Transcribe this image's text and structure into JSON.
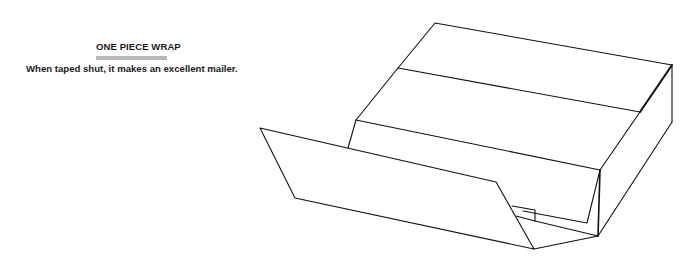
{
  "header": {
    "title": "ONE PIECE WRAP",
    "caption": "When taped shut, it makes an excellent mailer."
  },
  "illustration": {
    "subject": "one-piece-wrap-box",
    "description": "Line drawing of an open one-piece wrap corrugated box with front flap folded down",
    "colors": {
      "line": "#111111",
      "accent_bar": "#b8b8b8",
      "background": "#ffffff"
    }
  }
}
